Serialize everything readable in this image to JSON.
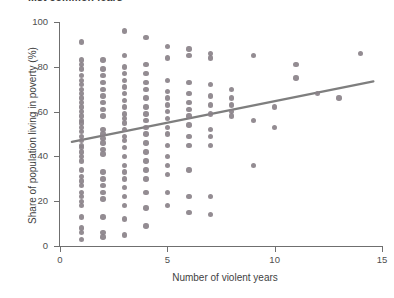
{
  "title": "...st common fears",
  "chart_data": {
    "type": "scatter",
    "title": "...st common fears",
    "xlabel": "Number of violent years",
    "ylabel": "Share of population living in poverty (%)",
    "xlim": [
      0,
      15
    ],
    "ylim": [
      0,
      100
    ],
    "xticks": [
      0,
      5,
      10,
      15
    ],
    "yticks": [
      0,
      20,
      40,
      60,
      80,
      100
    ],
    "xtick_labels": [
      "0",
      "5",
      "10",
      "15"
    ],
    "ytick_labels": [
      "0",
      "20",
      "40",
      "60",
      "80",
      "100"
    ],
    "grid": false,
    "legend": null,
    "marker_color": "#8a8289",
    "trendline_color": "#7e7e7e",
    "axis_color": "#6f6f6f",
    "background": "#ffffff",
    "series": [
      {
        "name": "Countries",
        "points": [
          [
            1,
            91
          ],
          [
            1,
            83
          ],
          [
            1,
            81
          ],
          [
            1,
            79
          ],
          [
            1,
            76
          ],
          [
            1,
            74
          ],
          [
            1,
            72
          ],
          [
            1,
            70
          ],
          [
            1,
            68
          ],
          [
            1,
            66
          ],
          [
            1,
            64
          ],
          [
            1,
            62
          ],
          [
            1,
            60
          ],
          [
            1,
            58
          ],
          [
            1,
            56
          ],
          [
            1,
            55
          ],
          [
            1,
            53
          ],
          [
            1,
            51
          ],
          [
            1,
            49
          ],
          [
            1,
            47
          ],
          [
            1,
            45
          ],
          [
            1,
            44
          ],
          [
            1,
            42
          ],
          [
            1,
            40
          ],
          [
            1,
            38
          ],
          [
            1,
            34
          ],
          [
            1,
            31
          ],
          [
            1,
            29
          ],
          [
            1,
            27
          ],
          [
            1,
            24
          ],
          [
            1,
            22
          ],
          [
            1,
            20
          ],
          [
            1,
            18
          ],
          [
            1,
            13
          ],
          [
            1,
            8
          ],
          [
            1,
            6
          ],
          [
            1,
            3
          ],
          [
            2,
            83
          ],
          [
            2,
            79
          ],
          [
            2,
            76
          ],
          [
            2,
            73
          ],
          [
            2,
            70
          ],
          [
            2,
            67
          ],
          [
            2,
            64
          ],
          [
            2,
            61
          ],
          [
            2,
            58
          ],
          [
            2,
            52
          ],
          [
            2,
            50
          ],
          [
            2,
            48
          ],
          [
            2,
            46
          ],
          [
            2,
            43
          ],
          [
            2,
            41
          ],
          [
            2,
            33
          ],
          [
            2,
            30
          ],
          [
            2,
            27
          ],
          [
            2,
            24
          ],
          [
            2,
            21
          ],
          [
            2,
            13
          ],
          [
            2,
            6
          ],
          [
            2,
            4
          ],
          [
            3,
            96
          ],
          [
            3,
            85
          ],
          [
            3,
            80
          ],
          [
            3,
            77
          ],
          [
            3,
            74
          ],
          [
            3,
            71
          ],
          [
            3,
            68
          ],
          [
            3,
            65
          ],
          [
            3,
            62
          ],
          [
            3,
            59
          ],
          [
            3,
            57
          ],
          [
            3,
            55
          ],
          [
            3,
            52
          ],
          [
            3,
            49
          ],
          [
            3,
            47
          ],
          [
            3,
            44
          ],
          [
            3,
            40
          ],
          [
            3,
            36
          ],
          [
            3,
            33
          ],
          [
            3,
            30
          ],
          [
            3,
            26
          ],
          [
            3,
            22
          ],
          [
            3,
            18
          ],
          [
            3,
            12
          ],
          [
            3,
            5
          ],
          [
            4,
            93
          ],
          [
            4,
            81
          ],
          [
            4,
            77
          ],
          [
            4,
            73
          ],
          [
            4,
            70
          ],
          [
            4,
            66
          ],
          [
            4,
            62
          ],
          [
            4,
            59
          ],
          [
            4,
            56
          ],
          [
            4,
            53
          ],
          [
            4,
            50
          ],
          [
            4,
            46
          ],
          [
            4,
            42
          ],
          [
            4,
            38
          ],
          [
            4,
            34
          ],
          [
            4,
            30
          ],
          [
            4,
            24
          ],
          [
            4,
            17
          ],
          [
            4,
            9
          ],
          [
            5,
            89
          ],
          [
            5,
            84
          ],
          [
            5,
            74
          ],
          [
            5,
            69
          ],
          [
            5,
            66
          ],
          [
            5,
            63
          ],
          [
            5,
            60
          ],
          [
            5,
            57
          ],
          [
            5,
            53
          ],
          [
            5,
            50
          ],
          [
            5,
            45
          ],
          [
            5,
            40
          ],
          [
            5,
            36
          ],
          [
            5,
            32
          ],
          [
            5,
            24
          ],
          [
            5,
            18
          ],
          [
            6,
            88
          ],
          [
            6,
            85
          ],
          [
            6,
            73
          ],
          [
            6,
            68
          ],
          [
            6,
            64
          ],
          [
            6,
            61
          ],
          [
            6,
            58
          ],
          [
            6,
            54
          ],
          [
            6,
            49
          ],
          [
            6,
            45
          ],
          [
            6,
            34
          ],
          [
            6,
            22
          ],
          [
            6,
            15
          ],
          [
            7,
            86
          ],
          [
            7,
            84
          ],
          [
            7,
            72
          ],
          [
            7,
            67
          ],
          [
            7,
            63
          ],
          [
            7,
            59
          ],
          [
            7,
            52
          ],
          [
            7,
            49
          ],
          [
            7,
            45
          ],
          [
            7,
            22
          ],
          [
            7,
            14
          ],
          [
            8,
            70
          ],
          [
            8,
            66
          ],
          [
            8,
            63
          ],
          [
            8,
            60
          ],
          [
            8,
            58
          ],
          [
            9,
            85
          ],
          [
            9,
            56
          ],
          [
            9,
            36
          ],
          [
            10,
            62
          ],
          [
            10,
            53
          ],
          [
            11,
            81
          ],
          [
            11,
            75
          ],
          [
            12,
            68
          ],
          [
            13,
            66
          ],
          [
            14,
            86
          ]
        ]
      }
    ],
    "trendline": {
      "type": "linear",
      "x_start": 0.55,
      "y_start": 46.5,
      "x_end": 14.6,
      "y_end": 73.5
    }
  }
}
